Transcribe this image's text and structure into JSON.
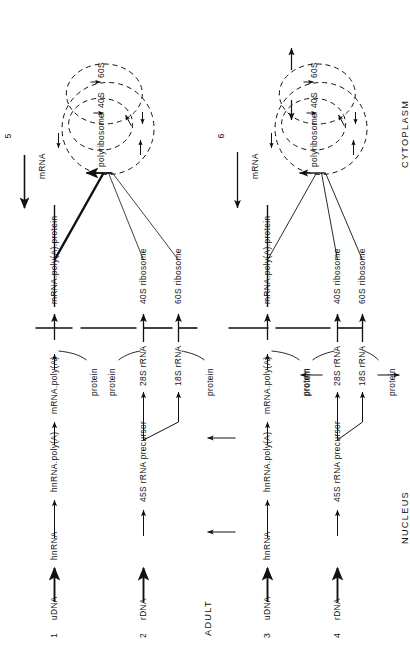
{
  "figure": {
    "compartments": [
      {
        "name": "NUCLEUS"
      },
      {
        "name": "CYTOPLASM"
      }
    ],
    "stage_label": "ADULT",
    "row_numbers": [
      "1",
      "2",
      "3",
      "4"
    ],
    "panel_numbers": [
      "5",
      "6"
    ],
    "nucleus_rows": [
      {
        "number": "1",
        "kind": "mrna",
        "chain": [
          "uDNA",
          "hnRNA",
          "hnRNA.poly(A)",
          "mRNA.poly(A)"
        ],
        "protein_inputs": [
          "protein"
        ],
        "bold_first_arrow": true,
        "has_lateral_arrows": false
      },
      {
        "number": "2",
        "kind": "rrna",
        "chain": [
          "rDNA",
          "45S rRNA precursor"
        ],
        "products": [
          "28S rRNA",
          "18S rRNA"
        ],
        "protein_inputs": [
          "protein",
          "protein"
        ],
        "bold_first_arrow": true,
        "has_lateral_arrows": false
      },
      {
        "number": "3",
        "kind": "mrna",
        "chain": [
          "uDNA",
          "hnRNA",
          "hnRNA.poly(A)",
          "mRNA.poly(A)"
        ],
        "protein_inputs": [
          "protein"
        ],
        "bold_first_arrow": true,
        "has_lateral_arrows": true
      },
      {
        "number": "4",
        "kind": "rrna",
        "chain": [
          "rDNA",
          "45S rRNA precursor"
        ],
        "products": [
          "28S rRNA",
          "18S rRNA"
        ],
        "protein_inputs": [
          "protein",
          "protein"
        ],
        "bold_first_arrow": true,
        "has_lateral_arrows": true
      }
    ],
    "cytoplasm_panels": [
      {
        "number": "5",
        "inputs": [
          "mRNA.poly(A).protein",
          "40S ribosome",
          "60S ribosome"
        ],
        "cycle_labels": [
          "mRNA",
          "polyribosome",
          "40S",
          "60S"
        ],
        "bold_mrna_input": true,
        "exit_arrow": true,
        "subunit_recycle_arrows": false
      },
      {
        "number": "6",
        "inputs": [
          "mRNA.poly(A).protein",
          "40S ribosome",
          "60S ribosome"
        ],
        "cycle_labels": [
          "mRNA",
          "polyribosome",
          "40S",
          "60S"
        ],
        "bold_mrna_input": false,
        "exit_arrow": true,
        "subunit_recycle_arrows": true
      }
    ],
    "colors": {
      "ink": "#111111",
      "background": "#ffffff"
    }
  }
}
